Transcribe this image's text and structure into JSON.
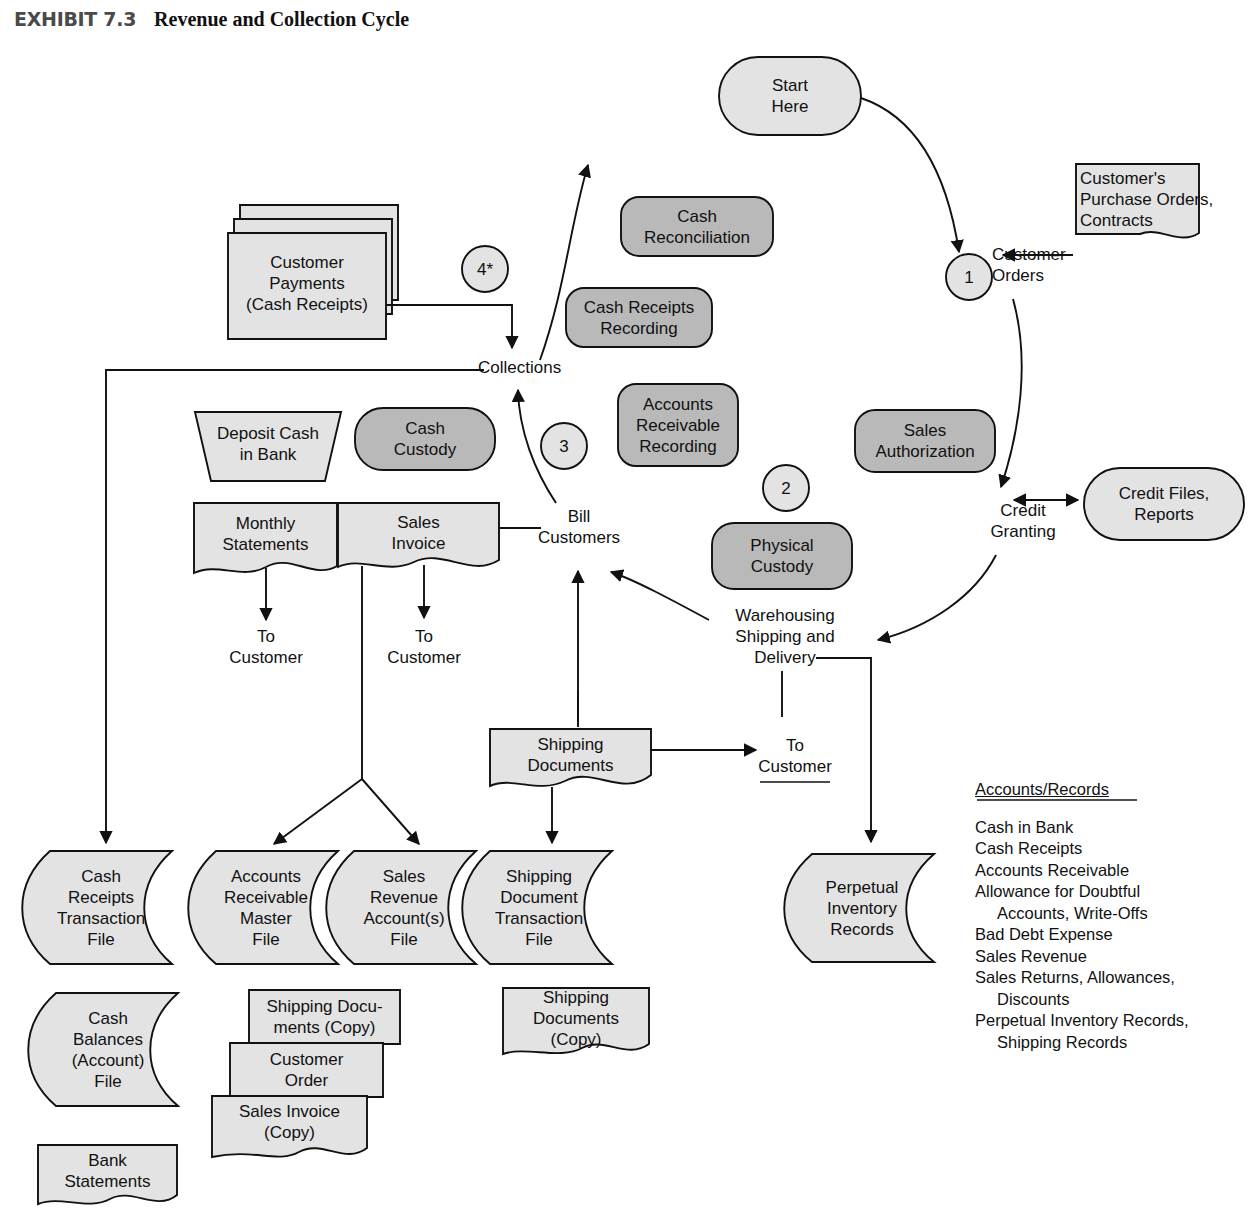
{
  "exhibit": {
    "label": "EXHIBIT 7.3",
    "title": "Revenue and Collection Cycle"
  },
  "colors": {
    "light_fill": "#e3e3e3",
    "dark_fill": "#b9b9b9",
    "stroke": "#111111",
    "page_background": "#ffffff",
    "header_label": "#4a4a4a"
  },
  "process_nodes": {
    "start_here": "Start\nHere",
    "customer_orders": "Customer\nOrders",
    "credit_granting": "Credit\nGranting",
    "warehousing": "Warehousing\nShipping and\nDelivery",
    "bill_customers": "Bill\nCustomers",
    "collections": "Collections"
  },
  "circles": [
    {
      "id": "circle-1",
      "label": "1"
    },
    {
      "id": "circle-2",
      "label": "2"
    },
    {
      "id": "circle-3",
      "label": "3"
    },
    {
      "id": "circle-4",
      "label": "4*"
    }
  ],
  "function_boxes": [
    {
      "id": "cash-reconciliation",
      "label": "Cash\nReconciliation"
    },
    {
      "id": "cash-receipts-recording",
      "label": "Cash Receipts\nRecording"
    },
    {
      "id": "accounts-receivable-recording",
      "label": "Accounts\nReceivable\nRecording"
    },
    {
      "id": "sales-authorization",
      "label": "Sales\nAuthorization"
    },
    {
      "id": "cash-custody",
      "label": "Cash\nCustody"
    },
    {
      "id": "physical-custody",
      "label": "Physical\nCustody"
    }
  ],
  "rounded_data_nodes": [
    {
      "id": "credit-files-reports",
      "label": "Credit Files,\nReports"
    }
  ],
  "documents": [
    {
      "id": "customers-purchase-orders",
      "label": "Customer's\nPurchase Orders,\nContracts"
    },
    {
      "id": "customer-payments",
      "label": "Customer\nPayments\n(Cash Receipts)"
    },
    {
      "id": "monthly-statements",
      "label": "Monthly\nStatements"
    },
    {
      "id": "sales-invoice",
      "label": "Sales\nInvoice"
    },
    {
      "id": "shipping-documents",
      "label": "Shipping\nDocuments"
    },
    {
      "id": "shipping-documents-copy-stack-top",
      "label": "Shipping Docu-\nments (Copy)"
    },
    {
      "id": "customer-order-copy",
      "label": "Customer\nOrder"
    },
    {
      "id": "sales-invoice-copy",
      "label": "Sales Invoice\n(Copy)"
    },
    {
      "id": "shipping-documents-copy",
      "label": "Shipping\nDocuments\n(Copy)"
    },
    {
      "id": "bank-statements",
      "label": "Bank\nStatements"
    }
  ],
  "manual_operation": {
    "id": "deposit-cash-in-bank",
    "label": "Deposit Cash\nin Bank"
  },
  "files": [
    {
      "id": "cash-receipts-transaction-file",
      "label": "Cash\nReceipts\nTransaction\nFile"
    },
    {
      "id": "accounts-receivable-master-file",
      "label": "Accounts\nReceivable\nMaster\nFile"
    },
    {
      "id": "sales-revenue-accounts-file",
      "label": "Sales\nRevenue\nAccount(s)\nFile"
    },
    {
      "id": "shipping-document-transaction-file",
      "label": "Shipping\nDocument\nTransaction\nFile"
    },
    {
      "id": "perpetual-inventory-records",
      "label": "Perpetual\nInventory\nRecords"
    },
    {
      "id": "cash-balances-account-file",
      "label": "Cash\nBalances\n(Account)\nFile"
    }
  ],
  "terminators": [
    {
      "id": "to-customer-statements",
      "label": "To\nCustomer"
    },
    {
      "id": "to-customer-invoice",
      "label": "To\nCustomer"
    },
    {
      "id": "to-customer-shipping",
      "label": "To\nCustomer"
    }
  ],
  "accounts_records": {
    "title": "Accounts/Records",
    "items": [
      {
        "text": "Cash in Bank",
        "indent": false
      },
      {
        "text": "Cash Receipts",
        "indent": false
      },
      {
        "text": "Accounts Receivable",
        "indent": false
      },
      {
        "text": "Allowance for Doubtful",
        "indent": false
      },
      {
        "text": "Accounts, Write-Offs",
        "indent": true
      },
      {
        "text": "Bad Debt Expense",
        "indent": false
      },
      {
        "text": "Sales Revenue",
        "indent": false
      },
      {
        "text": "Sales Returns, Allowances,",
        "indent": false
      },
      {
        "text": "Discounts",
        "indent": true
      },
      {
        "text": "Perpetual Inventory Records,",
        "indent": false
      },
      {
        "text": "Shipping Records",
        "indent": true
      }
    ]
  }
}
